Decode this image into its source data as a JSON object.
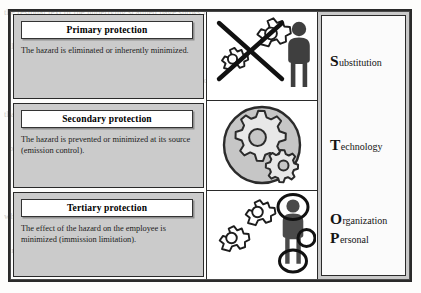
{
  "figure": {
    "concept": "STOP principle - hierarchy of protective measures",
    "frame_color": "#2a2a2a",
    "panel_fill": "#cbcbcb",
    "acronym_band_fill": "#c9c9c9"
  },
  "rows": [
    {
      "id": "primary",
      "title": "Primary protection",
      "description": "The hazard is eliminated or inherently minimized.",
      "icon_name": "gears-crossed-out-with-person-icon",
      "icon_meaning": "two gears struck through by an X beside a standing person"
    },
    {
      "id": "secondary",
      "title": "Secondary protection",
      "description": "The hazard is prevented or minimized at its source (emission control).",
      "icon_name": "gears-enclosed-in-circle-icon",
      "icon_meaning": "large and small gear contained inside a circular enclosure"
    },
    {
      "id": "tertiary",
      "title": "Tertiary protection",
      "description": "The effect of the hazard on the employee is minimized (immission limitation).",
      "icon_name": "gears-with-person-wearing-ppe-icon",
      "icon_meaning": "two gears beside a person with circles marking helmet, glove and boots"
    }
  ],
  "acronym": {
    "cells": [
      {
        "words": [
          {
            "cap": "S",
            "rest": "ubstitution"
          }
        ]
      },
      {
        "words": [
          {
            "cap": "T",
            "rest": "echnology"
          }
        ]
      },
      {
        "words": [
          {
            "cap": "O",
            "rest": "rganization"
          },
          {
            "cap": "P",
            "rest": "ersonal"
          }
        ]
      }
    ]
  },
  "background_ghost_text": [
    "the residual text of the underlying scanned page shows faintly",
    "through the figure from the reverse side of the sheet",
    "and remains only as a light grey impression of printed lines",
    "that cannot be read clearly at this reproduction size",
    "because the scan has bled through the paper stock",
    "leaving an uneven grey wash behind the illustration",
    "which the figure frame partially conceals from view",
    "in the lower half of the reproduced page area"
  ]
}
